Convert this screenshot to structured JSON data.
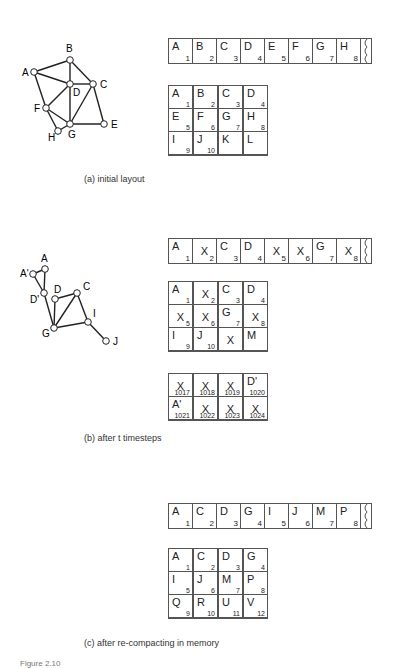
{
  "panels": [
    {
      "caption": "(a) initial layout",
      "graph": {
        "nodes": [
          {
            "id": "A",
            "label": "A",
            "x": 34,
            "y": 72,
            "lx": -12,
            "ly": 4
          },
          {
            "id": "B",
            "label": "B",
            "x": 70,
            "y": 60,
            "lx": -4,
            "ly": -8
          },
          {
            "id": "C",
            "label": "C",
            "x": 93,
            "y": 84,
            "lx": 7,
            "ly": 4
          },
          {
            "id": "D",
            "label": "D",
            "x": 70,
            "y": 84,
            "lx": 3,
            "ly": 12
          },
          {
            "id": "E",
            "label": "E",
            "x": 104,
            "y": 124,
            "lx": 7,
            "ly": 4
          },
          {
            "id": "F",
            "label": "F",
            "x": 46,
            "y": 108,
            "lx": -12,
            "ly": 4
          },
          {
            "id": "G",
            "label": "G",
            "x": 70,
            "y": 124,
            "lx": -2,
            "ly": 14
          },
          {
            "id": "H",
            "label": "H",
            "x": 58,
            "y": 131,
            "lx": -10,
            "ly": 10
          }
        ],
        "edges": [
          [
            "A",
            "B"
          ],
          [
            "A",
            "D"
          ],
          [
            "A",
            "F"
          ],
          [
            "B",
            "D"
          ],
          [
            "B",
            "C"
          ],
          [
            "D",
            "C"
          ],
          [
            "D",
            "F"
          ],
          [
            "D",
            "G"
          ],
          [
            "C",
            "G"
          ],
          [
            "C",
            "E"
          ],
          [
            "G",
            "E"
          ],
          [
            "F",
            "G"
          ],
          [
            "F",
            "H"
          ],
          [
            "H",
            "G"
          ]
        ]
      },
      "strip": [
        {
          "label": "A",
          "n": "1"
        },
        {
          "label": "B",
          "n": "2"
        },
        {
          "label": "C",
          "n": "3"
        },
        {
          "label": "D",
          "n": "4"
        },
        {
          "label": "E",
          "n": "5"
        },
        {
          "label": "F",
          "n": "6"
        },
        {
          "label": "G",
          "n": "7"
        },
        {
          "label": "H",
          "n": "8"
        }
      ],
      "grid": [
        {
          "label": "A",
          "n": "1"
        },
        {
          "label": "B",
          "n": "2"
        },
        {
          "label": "C",
          "n": "3"
        },
        {
          "label": "D",
          "n": "4"
        },
        {
          "label": "E",
          "n": "5"
        },
        {
          "label": "F",
          "n": "6"
        },
        {
          "label": "G",
          "n": "7"
        },
        {
          "label": "H",
          "n": "8"
        },
        {
          "label": "I",
          "n": "9"
        },
        {
          "label": "J",
          "n": "10"
        },
        {
          "label": "K",
          "n": ""
        },
        {
          "label": "L",
          "n": ""
        }
      ]
    },
    {
      "caption": "(b) after t timesteps",
      "graph": {
        "nodes": [
          {
            "id": "A",
            "label": "A",
            "x": 45,
            "y": 269,
            "lx": -4,
            "ly": -7
          },
          {
            "id": "A'",
            "label": "A'",
            "x": 33,
            "y": 274,
            "lx": -13,
            "ly": 3
          },
          {
            "id": "D'",
            "label": "D'",
            "x": 44,
            "y": 293,
            "lx": -14,
            "ly": 10
          },
          {
            "id": "D",
            "label": "D",
            "x": 55,
            "y": 299,
            "lx": -1,
            "ly": -6
          },
          {
            "id": "C",
            "label": "C",
            "x": 77,
            "y": 293,
            "lx": 6,
            "ly": -3
          },
          {
            "id": "G",
            "label": "G",
            "x": 54,
            "y": 328,
            "lx": -12,
            "ly": 9
          },
          {
            "id": "I",
            "label": "I",
            "x": 88,
            "y": 322,
            "lx": 5,
            "ly": -5
          },
          {
            "id": "J",
            "label": "J",
            "x": 106,
            "y": 341,
            "lx": 7,
            "ly": 4
          }
        ],
        "edges": [
          [
            "A",
            "A'"
          ],
          [
            "A",
            "D'"
          ],
          [
            "A'",
            "D'"
          ],
          [
            "D'",
            "G"
          ],
          [
            "D",
            "G"
          ],
          [
            "D",
            "C"
          ],
          [
            "C",
            "G"
          ],
          [
            "C",
            "I"
          ],
          [
            "G",
            "I"
          ],
          [
            "I",
            "J"
          ]
        ]
      },
      "strip": [
        {
          "label": "A",
          "n": "1"
        },
        {
          "x": "X",
          "n": "2"
        },
        {
          "label": "C",
          "n": "3"
        },
        {
          "label": "D",
          "n": "4"
        },
        {
          "x": "X",
          "n": "5"
        },
        {
          "x": "X",
          "n": "6"
        },
        {
          "label": "G",
          "n": "7"
        },
        {
          "x": "X",
          "n": "8"
        }
      ],
      "grid": [
        {
          "label": "A",
          "n": "1"
        },
        {
          "x": "X",
          "n": "2"
        },
        {
          "label": "C",
          "n": "3"
        },
        {
          "label": "D",
          "n": "4"
        },
        {
          "x": "X",
          "n": "5"
        },
        {
          "x": "X",
          "n": "6"
        },
        {
          "label": "G",
          "n": "7"
        },
        {
          "x": "X",
          "n": "8"
        },
        {
          "label": "I",
          "n": "9"
        },
        {
          "label": "J",
          "n": "10"
        },
        {
          "x": "X",
          "n": ""
        },
        {
          "label": "M",
          "n": ""
        }
      ],
      "grid2": [
        {
          "x": "X",
          "n": "1017"
        },
        {
          "x": "X",
          "n": "1018"
        },
        {
          "x": "X",
          "n": "1019"
        },
        {
          "label": "D'",
          "n": "1020"
        },
        {
          "label": "A'",
          "n": "1021"
        },
        {
          "x": "X",
          "n": "1022"
        },
        {
          "x": "X",
          "n": "1023"
        },
        {
          "x": "X",
          "n": "1024"
        }
      ]
    },
    {
      "caption": "(c) after re-compacting in memory",
      "strip": [
        {
          "label": "A",
          "n": "1"
        },
        {
          "label": "C",
          "n": "2"
        },
        {
          "label": "D",
          "n": "3"
        },
        {
          "label": "G",
          "n": "4"
        },
        {
          "label": "I",
          "n": "5"
        },
        {
          "label": "J",
          "n": "6"
        },
        {
          "label": "M",
          "n": "7"
        },
        {
          "label": "P",
          "n": "8"
        }
      ],
      "grid": [
        {
          "label": "A",
          "n": "1"
        },
        {
          "label": "C",
          "n": "2"
        },
        {
          "label": "D",
          "n": "3"
        },
        {
          "label": "G",
          "n": "4"
        },
        {
          "label": "I",
          "n": "5"
        },
        {
          "label": "J",
          "n": "6"
        },
        {
          "label": "M",
          "n": "7"
        },
        {
          "label": "P",
          "n": "8"
        },
        {
          "label": "Q",
          "n": "9"
        },
        {
          "label": "R",
          "n": "10"
        },
        {
          "label": "U",
          "n": "11"
        },
        {
          "label": "V",
          "n": "12"
        }
      ]
    }
  ],
  "figure_label": "Figure 2.10"
}
